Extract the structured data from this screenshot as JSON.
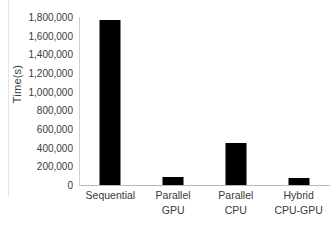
{
  "chart_data": {
    "type": "bar",
    "title": "",
    "xlabel": "",
    "ylabel": "Time(s)",
    "categories": [
      "Sequential",
      "Parallel GPU",
      "Parallel CPU",
      "Hybrid CPU-GPU"
    ],
    "category_lines": [
      [
        "Sequential",
        ""
      ],
      [
        "Parallel",
        "GPU"
      ],
      [
        "Parallel",
        "CPU"
      ],
      [
        "Hybrid",
        "CPU-GPU"
      ]
    ],
    "values": [
      1765000,
      85000,
      450000,
      75000
    ],
    "ylim": [
      0,
      1800000
    ],
    "ytick_values": [
      0,
      200000,
      400000,
      600000,
      800000,
      1000000,
      1200000,
      1400000,
      1600000,
      1800000
    ],
    "ytick_labels": [
      "0",
      "200,000",
      "400,000",
      "600,000",
      "800,000",
      "1,000,000",
      "1,200,000",
      "1,400,000",
      "1,600,000",
      "1,800,000"
    ],
    "grid": false,
    "legend": false,
    "legend_position": "none",
    "series_color": "#000000",
    "axis_color": "#b8b8b8",
    "text_color": "#3a3a3a",
    "background": "#ffffff"
  }
}
